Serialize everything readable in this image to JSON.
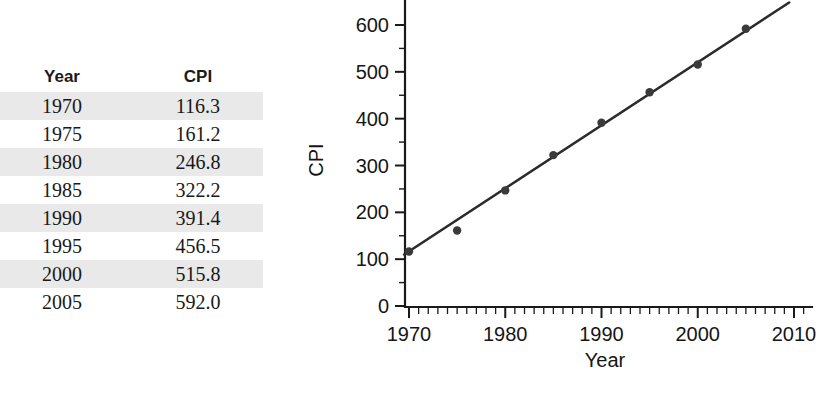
{
  "table": {
    "columns": [
      "Year",
      "CPI"
    ],
    "rows": [
      {
        "year": "1970",
        "cpi": "116.3"
      },
      {
        "year": "1975",
        "cpi": "161.2"
      },
      {
        "year": "1980",
        "cpi": "246.8"
      },
      {
        "year": "1985",
        "cpi": "322.2"
      },
      {
        "year": "1990",
        "cpi": "391.4"
      },
      {
        "year": "1995",
        "cpi": "456.5"
      },
      {
        "year": "2000",
        "cpi": "515.8"
      },
      {
        "year": "2005",
        "cpi": "592.0"
      }
    ],
    "band_color": "#e9e9e9"
  },
  "chart_data": {
    "type": "scatter",
    "title": "",
    "xlabel": "Year",
    "ylabel": "CPI",
    "x": [
      1970,
      1975,
      1980,
      1985,
      1990,
      1995,
      2000,
      2005
    ],
    "values": [
      116.3,
      161.2,
      246.8,
      322.2,
      391.4,
      456.5,
      515.8,
      592.0
    ],
    "series": [
      {
        "name": "CPI",
        "x": [
          1970,
          1975,
          1980,
          1985,
          1990,
          1995,
          2000,
          2005
        ],
        "values": [
          116.3,
          161.2,
          246.8,
          322.2,
          391.4,
          456.5,
          515.8,
          592.0
        ]
      }
    ],
    "trendline": {
      "type": "linear",
      "x_start": 1969.5,
      "y_start": 110.0,
      "x_end": 2009.5,
      "y_end": 648.0
    },
    "xlim": [
      1969,
      2011
    ],
    "ylim": [
      0,
      650
    ],
    "xticks": [
      1970,
      1980,
      1990,
      2000,
      2010
    ],
    "xtick_labels": [
      "1970",
      "1980",
      "1990",
      "2000",
      "2010"
    ],
    "x_minor_step": 1,
    "yticks": [
      0,
      100,
      200,
      300,
      400,
      500,
      600
    ],
    "ytick_labels": [
      "0",
      "100",
      "200",
      "300",
      "400",
      "500",
      "600"
    ],
    "y_minor_step": 50,
    "grid": false,
    "legend": "none",
    "marker_color": "#3a3a3a",
    "line_color": "#2b2b2b"
  }
}
